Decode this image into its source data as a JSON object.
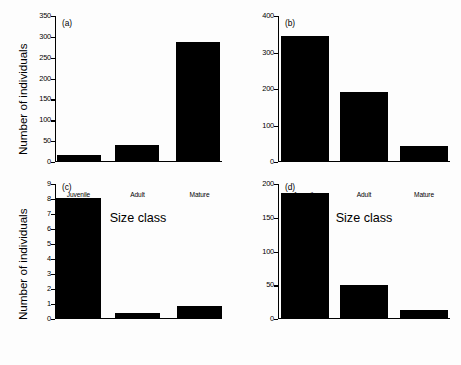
{
  "figure": {
    "ylabel_top": "Number of individuals",
    "ylabel_bottom": "Number of individuals",
    "xlabel_left": "Size class",
    "xlabel_right": "Size class"
  },
  "chart_data": [
    {
      "type": "bar",
      "tag": "(a)",
      "categories": [
        "Juvenile",
        "Adult",
        "Mature"
      ],
      "values": [
        18,
        40,
        288
      ],
      "title": "",
      "xlabel": "Size class",
      "ylabel": "Number of individuals",
      "ylim": [
        0,
        350
      ],
      "yticks": [
        0,
        50,
        100,
        150,
        200,
        250,
        300,
        350
      ],
      "grid": false,
      "legend": "none",
      "bar_color": "#000000"
    },
    {
      "type": "bar",
      "tag": "(b)",
      "categories": [
        "Juvenile",
        "Adult",
        "Mature"
      ],
      "values": [
        345,
        192,
        45
      ],
      "title": "",
      "xlabel": "Size class",
      "ylabel": "Number of individuals",
      "ylim": [
        0,
        400
      ],
      "yticks": [
        0,
        100,
        200,
        300,
        400
      ],
      "grid": false,
      "legend": "none",
      "bar_color": "#000000"
    },
    {
      "type": "bar",
      "tag": "(c)",
      "categories": [
        "Juvenile",
        "Adult",
        "Mature"
      ],
      "values": [
        8.1,
        0.4,
        0.85
      ],
      "title": "",
      "xlabel": "Size class",
      "ylabel": "Number of individuals",
      "ylim": [
        0,
        9
      ],
      "yticks": [
        0,
        1,
        2,
        3,
        4,
        5,
        6,
        7,
        8,
        9
      ],
      "grid": false,
      "legend": "none",
      "bar_color": "#000000"
    },
    {
      "type": "bar",
      "tag": "(d)",
      "categories": [
        "Juvenile",
        "Adult",
        "Mature"
      ],
      "values": [
        186,
        50,
        13
      ],
      "title": "",
      "xlabel": "Size class",
      "ylabel": "Number of individuals",
      "ylim": [
        0,
        200
      ],
      "yticks": [
        0,
        50,
        100,
        150,
        200
      ],
      "grid": false,
      "legend": "none",
      "bar_color": "#000000"
    }
  ]
}
